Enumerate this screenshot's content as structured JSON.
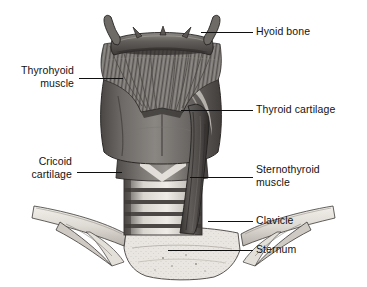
{
  "figure": {
    "background_color": "#ffffff",
    "ink_color": "#121212",
    "width": 367,
    "height": 287
  },
  "labels": [
    {
      "id": "hyoid-bone",
      "text": "Hyoid bone",
      "side": "right",
      "text_x": 256,
      "text_y": 25,
      "leader": {
        "x": 201,
        "y": 32,
        "length": 52
      }
    },
    {
      "id": "thyrohyoid-muscle",
      "text": "Thyrohyoid\nmuscle",
      "side": "left",
      "text_x": 14,
      "text_y": 64,
      "text_width": 60,
      "leader": {
        "x": 79,
        "y": 78,
        "length": 44
      }
    },
    {
      "id": "thyroid-cartilage",
      "text": "Thyroid cartilage",
      "side": "right",
      "text_x": 256,
      "text_y": 103,
      "leader": {
        "x": 181,
        "y": 110,
        "length": 72
      }
    },
    {
      "id": "cricoid-cartilage",
      "text": "Cricoid\ncartilage",
      "side": "left",
      "text_x": 10,
      "text_y": 155,
      "text_width": 62,
      "leader": {
        "x": 77,
        "y": 172,
        "length": 45
      }
    },
    {
      "id": "sternothyroid-muscle",
      "text": "Sternothyroid\nmuscle",
      "side": "right",
      "text_x": 256,
      "text_y": 163,
      "leader": {
        "x": 190,
        "y": 177,
        "length": 63
      }
    },
    {
      "id": "clavicle",
      "text": "Clavicle",
      "side": "right",
      "text_x": 256,
      "text_y": 214,
      "leader": {
        "x": 208,
        "y": 221,
        "length": 45
      }
    },
    {
      "id": "sternum",
      "text": "Sternum",
      "side": "right",
      "text_x": 256,
      "text_y": 243,
      "leader": {
        "x": 168,
        "y": 250,
        "length": 85
      }
    }
  ],
  "structures": [
    {
      "id": "hyoid-bone",
      "name": "Hyoid bone",
      "shade": "#6d6a68"
    },
    {
      "id": "thyrohyoid-muscle",
      "name": "Thyrohyoid muscle",
      "shade": "#7a7674"
    },
    {
      "id": "thyroid-cartilage",
      "name": "Thyroid cartilage",
      "shade": "#5f5c5a"
    },
    {
      "id": "cricoid-cartilage",
      "name": "Cricoid cartilage",
      "shade": "#6b6866"
    },
    {
      "id": "trachea",
      "name": "Trachea",
      "shade": "#4f4c4a"
    },
    {
      "id": "sternothyroid-muscle",
      "name": "Sternothyroid muscle",
      "shade": "#565350"
    },
    {
      "id": "clavicle-left",
      "name": "Left clavicle",
      "shade": "#dcd9d4"
    },
    {
      "id": "clavicle-right",
      "name": "Right clavicle",
      "shade": "#dcd9d4"
    },
    {
      "id": "sternum",
      "name": "Sternum",
      "shade": "#e6e3de"
    }
  ]
}
